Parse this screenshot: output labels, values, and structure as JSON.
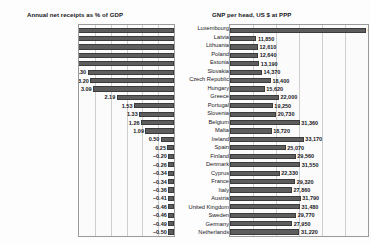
{
  "chart_data": [
    {
      "type": "bar",
      "orientation": "horizontal-left",
      "title": "Annual net receipts as % of GDP",
      "xlabel": "",
      "ylabel": "",
      "grid": true,
      "xlim": [
        -0.5,
        6.0
      ],
      "categories": [
        "Luxembourg",
        "Latvia",
        "Lithuania",
        "Poland",
        "Estonia",
        "Slovakia",
        "Czech Republic",
        "Hungary",
        "Greece",
        "Portugal",
        "Slovenia",
        "Belgium",
        "Malta",
        "Ireland",
        "Spain",
        "Finland",
        "Denmark",
        "Cyprus",
        "France",
        "Italy",
        "Austria",
        "United Kingdom",
        "Sweden",
        "Germany",
        "Netherlands"
      ],
      "values": [
        5.83,
        4.44,
        4.43,
        3.79,
        3.78,
        3.3,
        3.2,
        3.09,
        2.19,
        1.53,
        1.33,
        1.26,
        1.09,
        0.5,
        0.25,
        -0.2,
        -0.26,
        -0.34,
        -0.34,
        -0.36,
        -0.41,
        -0.46,
        -0.46,
        -0.49,
        -0.5
      ],
      "labels": [
        "5.83",
        "4.44",
        "4.43",
        "3.79",
        "3.78",
        "3.30",
        "3.20",
        "3.09",
        "2.19",
        "1.53",
        "1.33",
        "1.26",
        "1.09",
        "0.50",
        "0.25",
        "-0.20",
        "-0.26",
        "-0.34",
        "-0.34",
        "-0.36",
        "-0.41",
        "-0.46",
        "-0.46",
        "-0.49",
        "-0.50"
      ]
    },
    {
      "type": "bar",
      "orientation": "horizontal-right",
      "title": "GNP per head, US $ at PPP",
      "xlabel": "",
      "ylabel": "",
      "grid": true,
      "xlim": [
        0,
        62000
      ],
      "categories": [
        "Luxembourg",
        "Latvia",
        "Lithuania",
        "Poland",
        "Estonia",
        "Slovakia",
        "Czech Republic",
        "Hungary",
        "Greece",
        "Portugal",
        "Slovenia",
        "Belgium",
        "Malta",
        "Ireland",
        "Spain",
        "Finland",
        "Denmark",
        "Cyprus",
        "France",
        "Italy",
        "Austria",
        "United Kingdom",
        "Sweden",
        "Germany",
        "Netherlands"
      ],
      "values": [
        61220,
        11850,
        12610,
        12640,
        13190,
        14370,
        18400,
        15620,
        22000,
        19250,
        20730,
        31360,
        18720,
        33170,
        25070,
        29560,
        31550,
        22330,
        29320,
        27860,
        31790,
        31480,
        29770,
        27950,
        31220
      ],
      "labels": [
        "61,220",
        "11,850",
        "12,610",
        "12,640",
        "13,190",
        "14,370",
        "18,400",
        "15,620",
        "22,000",
        "19,250",
        "20,730",
        "31,360",
        "18,720",
        "33,170",
        "25,070",
        "29,560",
        "31,550",
        "22,330",
        "29,320",
        "27,860",
        "31,790",
        "31,480",
        "29,770",
        "27,950",
        "31,220"
      ]
    }
  ]
}
